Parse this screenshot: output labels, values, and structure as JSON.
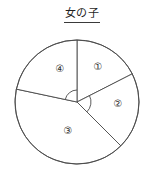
{
  "figure": {
    "title": "女の子",
    "title_underlined": true
  },
  "chart_data": {
    "type": "pie",
    "title": "女の子",
    "subtitle": "",
    "xlabel": "",
    "ylabel": "",
    "legend_position": "none",
    "grid": false,
    "labels_on_slices": true,
    "stroke_color": "#4a4a4a",
    "fill_color": "#ffffff",
    "center": {
      "cx": 77,
      "cy": 102
    },
    "radius": 62,
    "angle_marks": [
      {
        "name": "angle-arc-sector-4",
        "start_deg": 90,
        "end_deg": 168,
        "radius": 12
      },
      {
        "name": "angle-arc-sector-2",
        "start_deg": -45,
        "end_deg": 27,
        "radius": 14
      }
    ],
    "categories": [
      "①",
      "②",
      "③",
      "④"
    ],
    "values": [
      17.8,
      20.0,
      37.5,
      24.7
    ],
    "slices": [
      {
        "label": "①",
        "start_deg": 27,
        "end_deg": 90,
        "sweep_deg": 63,
        "value": 17.8,
        "label_x": 98,
        "label_y": 67
      },
      {
        "label": "②",
        "start_deg": -45,
        "end_deg": 27,
        "sweep_deg": 72,
        "value": 20.0,
        "label_x": 118,
        "label_y": 104
      },
      {
        "label": "③",
        "start_deg": 168,
        "end_deg": 315,
        "sweep_deg": 135,
        "value": 37.5,
        "label_x": 68,
        "label_y": 131
      },
      {
        "label": "④",
        "start_deg": 90,
        "end_deg": 168,
        "sweep_deg": 78,
        "value": 24.7,
        "label_x": 60,
        "label_y": 69
      }
    ]
  }
}
